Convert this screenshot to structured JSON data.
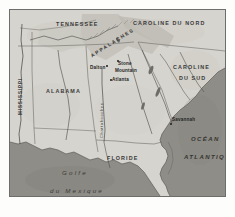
{
  "figure": {
    "kind": "reference-map",
    "language": "fr",
    "region": "Sud-Est des États-Unis",
    "palette": {
      "paper": "#fdfdfc",
      "land": "#d6d4ce",
      "land_highland": "#c3c1ba",
      "water": "#8f8d88",
      "frame": "#6d6d6d",
      "ink": "#2e2e2e",
      "border_line": "#6f6d68",
      "river": "#4a4a46"
    }
  },
  "states": [
    {
      "id": "tennessee",
      "label": "TENNESSEE",
      "x": 46,
      "y": 12
    },
    {
      "id": "caroline-nord",
      "label": "CAROLINE DU NORD",
      "x": 129,
      "y": 11
    },
    {
      "id": "caroline-sud-1",
      "label": "CAROLINE",
      "x": 164,
      "y": 55
    },
    {
      "id": "caroline-sud-2",
      "label": "DU SUD",
      "x": 170,
      "y": 66
    },
    {
      "id": "alabama",
      "label": "ALABAMA",
      "x": 36,
      "y": 79
    },
    {
      "id": "floride",
      "label": "FLORIDE",
      "x": 98,
      "y": 146
    },
    {
      "id": "mississippi",
      "label": "MISSISSIPPI",
      "x": 14,
      "y": 92
    }
  ],
  "waters": [
    {
      "id": "ocean-atlantique-1",
      "label": "OCÉAN",
      "x": 185,
      "y": 128
    },
    {
      "id": "ocean-atlantique-2",
      "label": "ATLANTIQUE",
      "x": 180,
      "y": 146
    },
    {
      "id": "golfe-1",
      "label": "Golfe",
      "x": 54,
      "y": 163
    },
    {
      "id": "golfe-2",
      "label": "du Mexique",
      "x": 42,
      "y": 181
    }
  ],
  "ranges": [
    {
      "id": "appalaches",
      "label": "APPALACHES",
      "x": 95,
      "y": 30
    }
  ],
  "rivers": [
    {
      "id": "chattahoochee",
      "label": "Chattahoochee",
      "x": 95,
      "y": 130
    }
  ],
  "cities": [
    {
      "id": "dalton",
      "label": "Dalton",
      "x": 86,
      "y": 58,
      "dot_x": 96,
      "dot_y": 55
    },
    {
      "id": "stone-mountain",
      "label": "Stone",
      "x": 109,
      "y": 54,
      "dot_x": 107,
      "dot_y": 52
    },
    {
      "id": "mountain",
      "label": "Mountain",
      "x": 107,
      "y": 61,
      "dot_x": -1,
      "dot_y": -1
    },
    {
      "id": "atlanta",
      "label": "Atlanta",
      "x": 103,
      "y": 70,
      "dot_x": 101,
      "dot_y": 69
    },
    {
      "id": "savannah",
      "label": "Savannah",
      "x": 163,
      "y": 110,
      "dot_x": 161,
      "dot_y": 113
    }
  ]
}
